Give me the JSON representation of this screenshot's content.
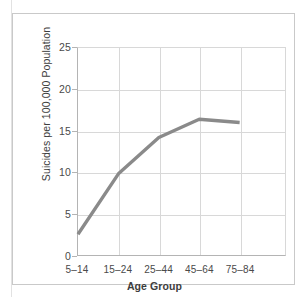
{
  "chart_data": {
    "type": "line",
    "title": "",
    "xlabel": "Age Group",
    "ylabel": "Suicides per 100,000 Population",
    "categories": [
      "5–14",
      "15–24",
      "25–44",
      "45–64",
      "75–84"
    ],
    "values": [
      2.5,
      9.8,
      14.2,
      16.4,
      16.0
    ],
    "ylim": [
      0,
      25
    ],
    "yticks": [
      "0",
      "5",
      "10",
      "15",
      "20",
      "25"
    ],
    "ytick_values": [
      0,
      5,
      10,
      15,
      20,
      25
    ],
    "grid": true,
    "legend": "none",
    "series_color": "#8a8a8a",
    "grid_color": "#d8d8d8",
    "axis_color": "#b4b4b4",
    "frame_color": "#c9c9c9"
  }
}
